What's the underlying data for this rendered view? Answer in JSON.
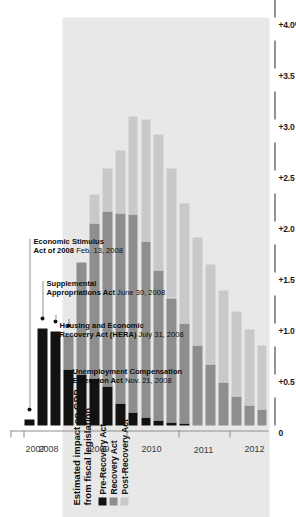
{
  "chart_data": {
    "type": "bar",
    "orientation": "horizontal-stacked",
    "title": "Estimated impact on GDP from fiscal legislation",
    "title_lines": [
      "Estimated impact on GDP",
      "from fiscal legislation"
    ],
    "xlabel": "",
    "ylabel": "",
    "value_axis_ticks": [
      "+4.0%",
      "+3.5",
      "+3.0",
      "+2.5",
      "+2.0",
      "+1.5",
      "+1.0",
      "+0.5",
      "0"
    ],
    "value_axis_values": [
      4.0,
      3.5,
      3.0,
      2.5,
      2.0,
      1.5,
      1.0,
      0.5,
      0
    ],
    "ylim": [
      0,
      4.0
    ],
    "grid": false,
    "legend_position": "top-left",
    "categories": [
      "2007Q4",
      "2008Q1",
      "2008Q2",
      "2008Q3",
      "2008Q4",
      "2009Q1",
      "2009Q2",
      "2009Q3",
      "2009Q4",
      "2010Q1",
      "2010Q2",
      "2010Q3",
      "2010Q4",
      "2011Q1",
      "2011Q2",
      "2011Q3",
      "2011Q4",
      "2012Q1",
      "2012Q2",
      "2012Q3"
    ],
    "year_ticks": [
      "2007",
      "2008",
      "2009",
      "2010",
      "2011",
      "2012"
    ],
    "series": [
      {
        "name": "Pre-Recovery Act",
        "color": "#121212",
        "values": [
          0.0,
          0.06,
          0.95,
          0.92,
          0.55,
          0.5,
          0.46,
          0.38,
          0.22,
          0.13,
          0.08,
          0.05,
          0.03,
          0.02,
          0.0,
          0.0,
          0.0,
          0.0,
          0.0,
          0.0
        ]
      },
      {
        "name": "Recovery Act",
        "color": "#8e8e8e",
        "values": [
          0.0,
          0.0,
          0.0,
          0.0,
          0.33,
          1.1,
          1.52,
          1.72,
          1.86,
          1.94,
          1.72,
          1.47,
          1.22,
          0.98,
          0.78,
          0.6,
          0.42,
          0.28,
          0.2,
          0.16
        ]
      },
      {
        "name": "Post-Recovery Act",
        "color": "#c9c9c9",
        "values": [
          0.0,
          0.0,
          0.0,
          0.0,
          0.0,
          0.0,
          0.28,
          0.42,
          0.62,
          0.96,
          1.2,
          1.33,
          1.27,
          1.18,
          1.06,
          0.98,
          0.9,
          0.84,
          0.74,
          0.62
        ]
      }
    ],
    "totals": [
      0.0,
      0.06,
      0.95,
      0.92,
      0.88,
      1.6,
      2.26,
      2.52,
      2.7,
      3.03,
      3.0,
      2.85,
      2.52,
      2.18,
      1.84,
      1.58,
      1.32,
      1.12,
      0.94,
      0.78
    ],
    "annotations": [
      {
        "title_lines": [
          "Unemployment Compensation",
          "Extension Act"
        ],
        "date": "Nov. 21, 2008",
        "target_category": "2008Q4"
      },
      {
        "title_lines": [
          "Housing and Economic",
          "Recovery Act (HERA)"
        ],
        "date": "July 31, 2008",
        "target_category": "2008Q3"
      },
      {
        "title_lines": [
          "Supplemental",
          "Appropriations Act"
        ],
        "date": "June 30, 2008",
        "target_category": "2008Q2"
      },
      {
        "title_lines": [
          "Economic Stimulus",
          "Act of 2008"
        ],
        "date": "Feb. 13, 2008",
        "target_category": "2008Q1"
      }
    ]
  },
  "legend": {
    "items": [
      {
        "label": "Pre-Recovery Act",
        "color": "#121212"
      },
      {
        "label": "Recovery Act",
        "color": "#8e8e8e"
      },
      {
        "label": "Post-Recovery Act",
        "color": "#c9c9c9"
      }
    ]
  },
  "axis": {
    "t0": "+4.0%",
    "t1": "+3.5",
    "t2": "+3.0",
    "t3": "+2.5",
    "t4": "+2.0",
    "t5": "+1.5",
    "t6": "+1.0",
    "t7": "+0.5",
    "t8": "0"
  },
  "years": {
    "y0": "2007",
    "y1": "2008",
    "y2": "2009",
    "y3": "2010",
    "y4": "2011",
    "y5": "2012"
  },
  "title": {
    "line1": "Estimated impact on GDP",
    "line2": "from fiscal legislation"
  },
  "annotations": {
    "a0": {
      "l1": "Unemployment Compensation",
      "l2": "Extension Act",
      "date": "Nov. 21, 2008"
    },
    "a1": {
      "l1": "Housing and Economic",
      "l2": "Recovery Act (HERA)",
      "date": "July 31, 2008"
    },
    "a2": {
      "l1": "Supplemental",
      "l2": "Appropriations Act",
      "date": "June 30, 2008"
    },
    "a3": {
      "l1": "Economic Stimulus",
      "l2": "Act of 2008",
      "date": "Feb. 13, 2008"
    }
  }
}
